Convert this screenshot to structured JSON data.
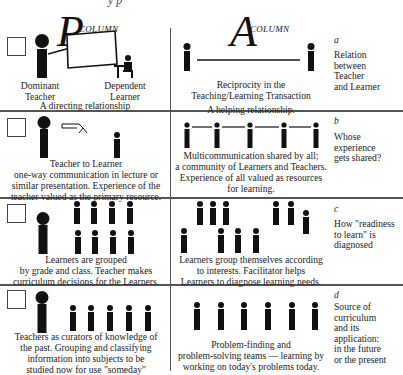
{
  "top_fragment": "y p",
  "columns": {
    "p": {
      "letter": "P",
      "label": "COLUMN"
    },
    "a": {
      "letter": "A",
      "label": "COLUMN"
    }
  },
  "rows": [
    {
      "key": "a",
      "side_letter": "a",
      "side_text": [
        "Relation",
        "between",
        "Teacher",
        "and Learner"
      ],
      "p_labels": {
        "left": [
          "Dominant",
          "Teacher"
        ],
        "right": [
          "Dependent",
          "Learner"
        ]
      },
      "p_caption": [
        "A directing relationship"
      ],
      "a_caption": [
        "Reciprocity in the",
        "Teaching/Learning Transaction",
        "A helping relationship."
      ]
    },
    {
      "key": "b",
      "side_letter": "b",
      "side_text": [
        "Whose",
        "experience",
        "gets shared?"
      ],
      "p_caption": [
        "Teacher to Learner",
        "one-way communication in lecture or",
        "similar presentation. Experience of the",
        "teacher valued as the primary resource."
      ],
      "a_caption": [
        "Multicommunication shared by all;",
        "a community of Learners and Teachers.",
        "Experience of all valued as resources",
        "for learning."
      ]
    },
    {
      "key": "c",
      "side_letter": "c",
      "side_text": [
        "How \"readiness",
        "to learn\" is",
        "diagnosed"
      ],
      "p_caption": [
        "Learners are grouped",
        "by grade and class. Teacher makes",
        "curriculum decisions for the Learners."
      ],
      "a_caption": [
        "Learners group themselves according",
        "to interests. Facilitator helps",
        "Learners to diagnose learning needs."
      ]
    },
    {
      "key": "d",
      "side_letter": "d",
      "side_text": [
        "Source of",
        "curriculum",
        "and its",
        "application:",
        "in the future",
        "or the present"
      ],
      "p_caption": [
        "Teachers as curators of knowledge of",
        "the past. Grouping and classifying",
        "information into subjects to be",
        "studied now for use \"someday\""
      ],
      "a_caption": [
        "Problem-finding and",
        "problem-solving teams — learning by",
        "working on today's problems today."
      ]
    }
  ],
  "icons": {
    "checkbox": "empty-square",
    "teacher": "large-person-silhouette",
    "learner": "small-person-silhouette",
    "seated_learner": "person-at-desk",
    "board": "chalkboard",
    "arrow": "curved-arrow"
  }
}
